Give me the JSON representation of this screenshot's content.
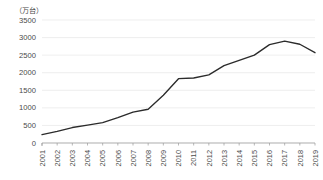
{
  "chart_data": {
    "type": "line",
    "title": "",
    "subtitle": "",
    "unit_label": "（万台）",
    "xlabel": "",
    "ylabel": "",
    "ylim": [
      0,
      3500
    ],
    "ytick_labels": [
      "3500",
      "3000",
      "2500",
      "2000",
      "1500",
      "1000",
      "500",
      "0"
    ],
    "ytick_values": [
      3500,
      3000,
      2500,
      2000,
      1500,
      1000,
      500,
      0
    ],
    "grid": true,
    "grid_axis": "y",
    "legend": false,
    "legend_position": "none",
    "line_color": "#2b2b2b",
    "grid_color": "#e2e2e2",
    "axis_color": "#9a9a9a",
    "categories": [
      "2001",
      "2002",
      "2003",
      "2004",
      "2005",
      "2006",
      "2007",
      "2008",
      "2009",
      "2010",
      "2011",
      "2012",
      "2013",
      "2014",
      "2015",
      "2016",
      "2017",
      "2018",
      "2019"
    ],
    "xtick_rotation": -90,
    "values": [
      240,
      330,
      440,
      510,
      580,
      720,
      880,
      960,
      1360,
      1830,
      1850,
      1940,
      2200,
      2350,
      2500,
      2800,
      2900,
      2810,
      2570
    ],
    "series": [
      {
        "name": "",
        "values": [
          240,
          330,
          440,
          510,
          580,
          720,
          880,
          960,
          1360,
          1830,
          1850,
          1940,
          2200,
          2350,
          2500,
          2800,
          2900,
          2810,
          2570
        ]
      }
    ]
  },
  "plot": {
    "left": 42,
    "right": 315,
    "top": 20,
    "bottom": 143
  }
}
